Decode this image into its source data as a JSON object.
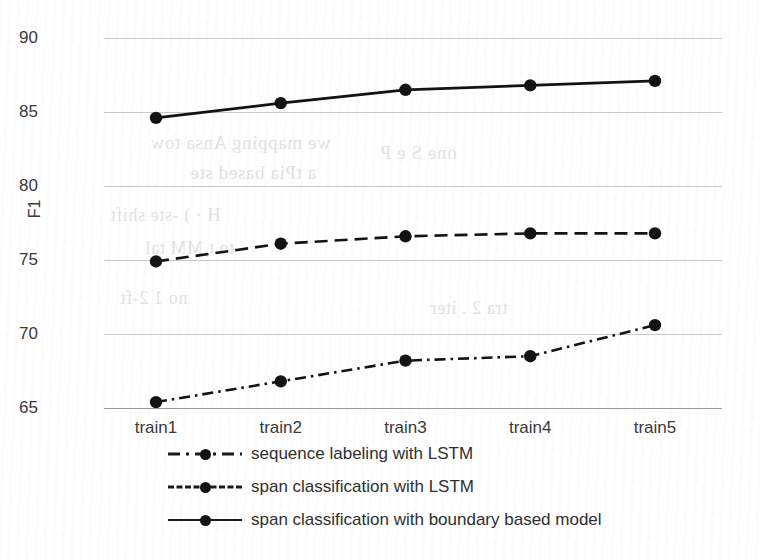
{
  "chart_data": {
    "type": "line",
    "title": "",
    "xlabel": "",
    "ylabel": "F1",
    "categories": [
      "train1",
      "train2",
      "train3",
      "train4",
      "train5"
    ],
    "ylim": [
      63.5,
      91.5
    ],
    "yticks": [
      65,
      70,
      75,
      80,
      85,
      90
    ],
    "grid": true,
    "legend_position": "bottom",
    "series": [
      {
        "name": "sequence labeling with LSTM",
        "style": "dash-dot",
        "marker": "circle",
        "color": "#131313",
        "values": [
          65.4,
          66.8,
          68.2,
          68.5,
          70.6
        ]
      },
      {
        "name": "span classification with LSTM",
        "style": "dashed",
        "marker": "circle",
        "color": "#131313",
        "values": [
          74.9,
          76.1,
          76.6,
          76.8,
          76.8
        ]
      },
      {
        "name": "span classification with boundary based model",
        "style": "solid",
        "marker": "circle",
        "color": "#131313",
        "values": [
          84.6,
          85.6,
          86.5,
          86.8,
          87.1
        ]
      }
    ]
  },
  "axis": {
    "y_title": "F1",
    "y_tick_labels": [
      "90",
      "85",
      "80",
      "75",
      "70",
      "65"
    ],
    "x_tick_labels": [
      "train1",
      "train2",
      "train3",
      "train4",
      "train5"
    ]
  },
  "legend": {
    "entries": [
      {
        "label": "sequence labeling with LSTM"
      },
      {
        "label": "span classification with LSTM"
      },
      {
        "label": "span classification with boundary based model"
      }
    ]
  },
  "background_ghost_text": [
    "we mapping  Ansa  tow",
    "a tPia  based ste",
    "H · ) -ste   shift",
    "to t,MM tal",
    "no 1 2-ft",
    "one S e P",
    "tra 2 . iter"
  ]
}
